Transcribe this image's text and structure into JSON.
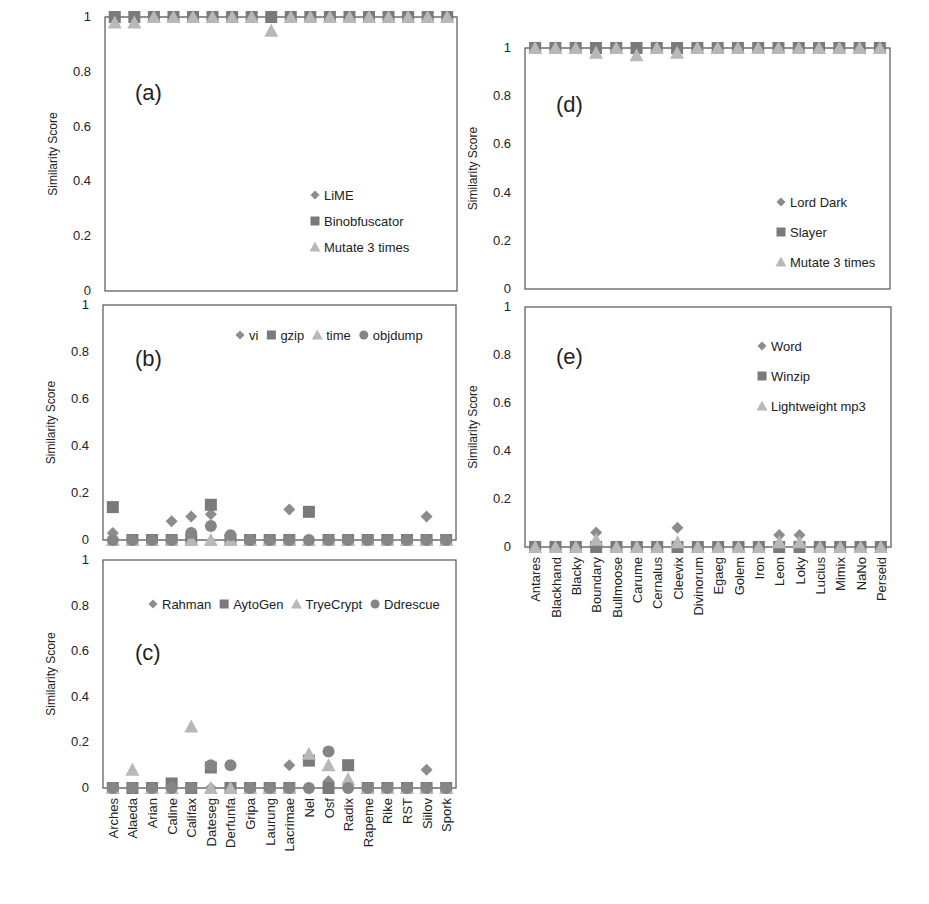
{
  "figure": {
    "y_axis_label": "Similarity Score",
    "y_ticks": [
      "0",
      "0.2",
      "0.4",
      "0.6",
      "0.8",
      "1"
    ],
    "marker_colors": {
      "diamond": "#8c8c8c",
      "square": "#7a7a7a",
      "triangle": "#b8b8b8",
      "circle": "#858585"
    }
  },
  "chart_data": [
    {
      "id": "a",
      "panel_label": "(a)",
      "type": "scatter",
      "title": "",
      "xlabel": "",
      "ylabel": "Similarity Score",
      "ylim": [
        0,
        1
      ],
      "grid": false,
      "legend_position": "lower-right, vertical",
      "categories": [
        "Arches",
        "Alaeda",
        "Arian",
        "Caline",
        "Califax",
        "Dateseg",
        "Derfunfa",
        "Gripa",
        "Laurung",
        "Lacrimae",
        "Nel",
        "Osf",
        "Radix",
        "Rapeme",
        "Rike",
        "RST",
        "Siilov",
        "Spork"
      ],
      "series": [
        {
          "name": "LiME",
          "marker": "diamond",
          "values": [
            1,
            1,
            1,
            1,
            1,
            1,
            1,
            1,
            1,
            1,
            1,
            1,
            1,
            1,
            1,
            1,
            1,
            1
          ]
        },
        {
          "name": "Binobfuscator",
          "marker": "square",
          "values": [
            1,
            1,
            1,
            1,
            1,
            1,
            1,
            1,
            1,
            1,
            1,
            1,
            1,
            1,
            1,
            1,
            1,
            1
          ]
        },
        {
          "name": "Mutate 3 times",
          "marker": "triangle",
          "values": [
            0.98,
            0.98,
            1,
            1,
            1,
            1,
            1,
            1,
            0.95,
            1,
            1,
            1,
            1,
            1,
            1,
            1,
            1,
            1
          ]
        }
      ]
    },
    {
      "id": "b",
      "panel_label": "(b)",
      "type": "scatter",
      "title": "",
      "xlabel": "",
      "ylabel": "Similarity Score",
      "ylim": [
        0,
        1
      ],
      "grid": false,
      "legend_position": "upper-right, horizontal",
      "categories": [
        "Arches",
        "Alaeda",
        "Arian",
        "Caline",
        "Califax",
        "Dateseg",
        "Derfunfa",
        "Gripa",
        "Laurung",
        "Lacrimae",
        "Nel",
        "Osf",
        "Radix",
        "Rapeme",
        "Rike",
        "RST",
        "Siilov",
        "Spork"
      ],
      "series": [
        {
          "name": "vi",
          "marker": "diamond",
          "values": [
            0.03,
            0,
            0,
            0.08,
            0.1,
            0.11,
            0.01,
            0,
            0,
            0.13,
            0,
            0,
            0,
            0,
            0,
            0,
            0.1,
            0
          ]
        },
        {
          "name": "gzip",
          "marker": "square",
          "values": [
            0.14,
            0,
            0,
            0,
            0,
            0.15,
            0,
            0,
            0,
            0,
            0.12,
            0,
            0,
            0,
            0,
            0,
            0,
            0
          ]
        },
        {
          "name": "time",
          "marker": "triangle",
          "values": [
            0,
            0,
            0,
            0,
            0,
            0,
            0,
            0,
            0,
            0,
            0,
            0,
            0,
            0,
            0,
            0,
            0,
            0
          ]
        },
        {
          "name": "objdump",
          "marker": "circle",
          "values": [
            0,
            0,
            0,
            0,
            0.03,
            0.06,
            0.02,
            0,
            0,
            0,
            0,
            0,
            0,
            0,
            0,
            0,
            0,
            0
          ]
        }
      ]
    },
    {
      "id": "c",
      "panel_label": "(c)",
      "type": "scatter",
      "title": "",
      "xlabel": "",
      "ylabel": "Similarity Score",
      "ylim": [
        0,
        1
      ],
      "grid": false,
      "legend_position": "upper-right, horizontal",
      "categories": [
        "Arches",
        "Alaeda",
        "Arian",
        "Caline",
        "Califax",
        "Dateseg",
        "Derfunfa",
        "Gripa",
        "Laurung",
        "Lacrimae",
        "Nel",
        "Osf",
        "Radix",
        "Rapeme",
        "Rike",
        "RST",
        "Siilov",
        "Spork"
      ],
      "series": [
        {
          "name": "Rahman",
          "marker": "diamond",
          "values": [
            0,
            0,
            0,
            0,
            0,
            0,
            0,
            0,
            0,
            0.1,
            0,
            0.03,
            0,
            0,
            0,
            0,
            0.08,
            0
          ]
        },
        {
          "name": "AytoGen",
          "marker": "square",
          "values": [
            0,
            0,
            0,
            0.02,
            0,
            0.09,
            0,
            0,
            0,
            0,
            0.12,
            0,
            0.1,
            0,
            0,
            0,
            0,
            0
          ]
        },
        {
          "name": "TryeCrypt",
          "marker": "triangle",
          "values": [
            0,
            0.08,
            0,
            0,
            0.27,
            0,
            0,
            0,
            0,
            0,
            0.15,
            0.1,
            0.04,
            0,
            0,
            0,
            0,
            0
          ]
        },
        {
          "name": "Ddrescue",
          "marker": "circle",
          "values": [
            0,
            0,
            0,
            0,
            0,
            0.1,
            0.1,
            0,
            0,
            0,
            0,
            0.16,
            0,
            0,
            0,
            0,
            0,
            0
          ]
        }
      ]
    },
    {
      "id": "d",
      "panel_label": "(d)",
      "type": "scatter",
      "title": "",
      "xlabel": "",
      "ylabel": "Similarity Score",
      "ylim": [
        0,
        1
      ],
      "grid": false,
      "legend_position": "lower-right, vertical",
      "categories": [
        "Antares",
        "Blackhand",
        "Blacky",
        "Boundary",
        "Bullmoose",
        "Carume",
        "Cernalus",
        "Cleevix",
        "Divinorum",
        "Egaeg",
        "Golem",
        "Iron",
        "Leon",
        "Loky",
        "Lucius",
        "Mimix",
        "NaNo",
        "Perseid"
      ],
      "series": [
        {
          "name": "Lord Dark",
          "marker": "diamond",
          "values": [
            1,
            1,
            1,
            1,
            1,
            1,
            1,
            1,
            1,
            1,
            1,
            1,
            1,
            1,
            1,
            1,
            1,
            1
          ]
        },
        {
          "name": "Slayer",
          "marker": "square",
          "values": [
            1,
            1,
            1,
            1,
            1,
            1,
            1,
            1,
            1,
            1,
            1,
            1,
            1,
            1,
            1,
            1,
            1,
            1
          ]
        },
        {
          "name": "Mutate 3 times",
          "marker": "triangle",
          "values": [
            1,
            1,
            1,
            0.98,
            1,
            0.97,
            1,
            0.98,
            1,
            1,
            1,
            1,
            1,
            1,
            1,
            1,
            1,
            1
          ]
        }
      ]
    },
    {
      "id": "e",
      "panel_label": "(e)",
      "type": "scatter",
      "title": "",
      "xlabel": "",
      "ylabel": "Similarity Score",
      "ylim": [
        0,
        1
      ],
      "grid": false,
      "legend_position": "upper-right, vertical",
      "categories": [
        "Antares",
        "Blackhand",
        "Blacky",
        "Boundary",
        "Bullmoose",
        "Carume",
        "Cernalus",
        "Cleevix",
        "Divinorum",
        "Egaeg",
        "Golem",
        "Iron",
        "Leon",
        "Loky",
        "Lucius",
        "Mimix",
        "NaNo",
        "Perseid"
      ],
      "series": [
        {
          "name": "Word",
          "marker": "diamond",
          "values": [
            0,
            0,
            0,
            0.06,
            0,
            0,
            0,
            0.08,
            0,
            0,
            0,
            0,
            0.05,
            0.05,
            0,
            0,
            0,
            0
          ]
        },
        {
          "name": "Winzip",
          "marker": "square",
          "values": [
            0,
            0,
            0,
            0,
            0,
            0,
            0,
            0,
            0,
            0,
            0,
            0,
            0,
            0,
            0,
            0,
            0,
            0
          ]
        },
        {
          "name": "Lightweight mp3",
          "marker": "triangle",
          "values": [
            0,
            0,
            0,
            0.03,
            0,
            0,
            0,
            0.02,
            0,
            0,
            0,
            0,
            0.02,
            0.02,
            0,
            0,
            0,
            0
          ]
        }
      ]
    }
  ]
}
